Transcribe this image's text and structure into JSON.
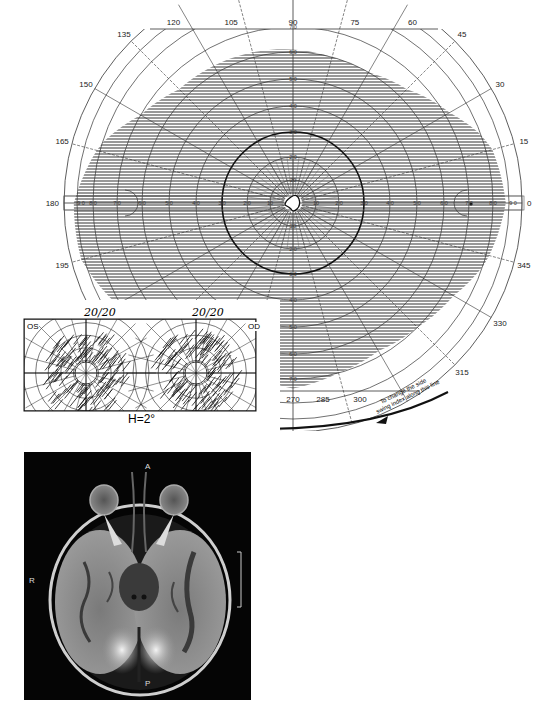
{
  "chart_data": [
    {
      "type": "polar-visual-field",
      "title": "Goldmann visual field chart",
      "angular_tick_labels": [
        "0",
        "15",
        "30",
        "45",
        "60",
        "75",
        "90",
        "105",
        "120",
        "135",
        "150",
        "165",
        "180",
        "195",
        "345",
        "330",
        "315",
        "300",
        "285",
        "270"
      ],
      "radial_tick_labels": [
        "10",
        "20",
        "30",
        "40",
        "50",
        "60",
        "70",
        "80",
        "90"
      ],
      "radial_unit": "degrees",
      "shaded_region": "peripheral field from ~15-20 deg out to ~60 deg superior, ~85 deg temporal, ~65 deg nasal, ~75 deg inferior (horizontal hatching)",
      "central_scotoma_deg": 3,
      "annotation": "To change the side, swing index along this line"
    },
    {
      "type": "amsler-grid",
      "panels": [
        {
          "label": "OS",
          "acuity": "20/20"
        },
        {
          "label": "OD",
          "acuity": "20/20"
        }
      ],
      "caption": "H=2°"
    }
  ],
  "perimetry": {
    "angles": [
      {
        "deg": 0,
        "label": "0"
      },
      {
        "deg": 15,
        "label": "15"
      },
      {
        "deg": 30,
        "label": "30"
      },
      {
        "deg": 45,
        "label": "45"
      },
      {
        "deg": 60,
        "label": "60"
      },
      {
        "deg": 75,
        "label": "75"
      },
      {
        "deg": 90,
        "label": "90"
      },
      {
        "deg": 105,
        "label": "105"
      },
      {
        "deg": 120,
        "label": "120"
      },
      {
        "deg": 135,
        "label": "135"
      },
      {
        "deg": 150,
        "label": "150"
      },
      {
        "deg": 165,
        "label": "165"
      },
      {
        "deg": 180,
        "label": "180"
      },
      {
        "deg": 195,
        "label": "195"
      },
      {
        "deg": 270,
        "label": "270"
      },
      {
        "deg": 285,
        "label": "285"
      },
      {
        "deg": 300,
        "label": "300"
      },
      {
        "deg": 315,
        "label": "315"
      },
      {
        "deg": 330,
        "label": "330"
      },
      {
        "deg": 345,
        "label": "345"
      }
    ],
    "horizontal_scale": [
      "9 0",
      "8 0",
      "7 0",
      "6 0",
      "5 0",
      "4 0",
      "3 0",
      "2 0",
      "10",
      "10",
      "2 0",
      "3 0",
      "4 0",
      "5 0",
      "6 0",
      "7 0",
      "8 0",
      "9 0"
    ],
    "vertical_scale_up": [
      "20",
      "2 0",
      "3 0",
      "4 0",
      "5 0",
      "6 0",
      "7 0"
    ],
    "vertical_scale_down": [
      "20",
      "2 0",
      "3 0",
      "4 0",
      "5 0",
      "6 0",
      "7 0"
    ],
    "swing_note_line1": "To change the side",
    "swing_note_line2": "swing index along this line"
  },
  "amsler": {
    "left_label": "OS",
    "right_label": "OD",
    "left_acuity": "20/20",
    "right_acuity": "20/20",
    "caption": "H=2°"
  },
  "mri": {
    "label_anterior": "A",
    "label_posterior": "P",
    "label_right": "R"
  }
}
